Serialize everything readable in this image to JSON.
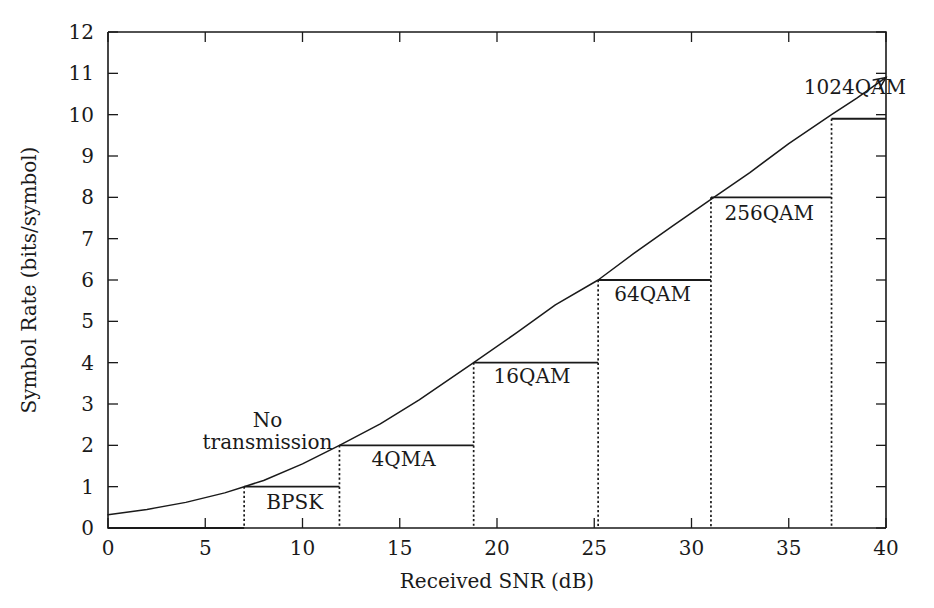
{
  "chart_data": {
    "type": "line",
    "title": "",
    "xlabel": "Received SNR (dB)",
    "ylabel": "Symbol Rate (bits/symbol)",
    "xlim": [
      0,
      40
    ],
    "ylim": [
      0,
      12
    ],
    "xticks": [
      "0",
      "5",
      "10",
      "15",
      "20",
      "25",
      "30",
      "35",
      "40"
    ],
    "xtick_values": [
      0,
      5,
      10,
      15,
      20,
      25,
      30,
      35,
      40
    ],
    "yticks": [
      "0",
      "1",
      "2",
      "3",
      "4",
      "5",
      "6",
      "7",
      "8",
      "9",
      "10",
      "11",
      "12"
    ],
    "ytick_values": [
      0,
      1,
      2,
      3,
      4,
      5,
      6,
      7,
      8,
      9,
      10,
      11,
      12
    ],
    "grid": false,
    "legend": "none",
    "series": [
      {
        "name": "Shannon capacity curve",
        "type": "line",
        "style": "solid",
        "arrow_end": true,
        "x": [
          0,
          2,
          4,
          6,
          7,
          8,
          10,
          11.9,
          14,
          16,
          18.8,
          21,
          23,
          25.2,
          27,
          29,
          31,
          33,
          35,
          37.2,
          38.5,
          40
        ],
        "y": [
          0.32,
          0.45,
          0.62,
          0.85,
          1.0,
          1.15,
          1.55,
          2.0,
          2.52,
          3.1,
          4.0,
          4.72,
          5.4,
          6.0,
          6.63,
          7.3,
          7.95,
          8.6,
          9.3,
          10.0,
          10.4,
          10.9
        ]
      },
      {
        "name": "Adaptive modulation step function",
        "type": "step",
        "boundaries": [
          0,
          7,
          11.9,
          18.8,
          25.2,
          31,
          37.2,
          40
        ],
        "levels": [
          0,
          1,
          2,
          4,
          6,
          8,
          9.9
        ]
      }
    ],
    "annotations": [
      {
        "text": "No",
        "x": 8.2,
        "y": 2.45,
        "label": "no-transmission-line1"
      },
      {
        "text": "transmission",
        "x": 8.2,
        "y": 1.9,
        "label": "no-transmission-line2"
      },
      {
        "text": "BPSK",
        "x": 9.6,
        "y": 0.45,
        "label": "bpsk-label"
      },
      {
        "text": "4QMA",
        "x": 15.2,
        "y": 1.5,
        "label": "4qma-label"
      },
      {
        "text": "16QAM",
        "x": 21.8,
        "y": 3.5,
        "label": "16qam-label"
      },
      {
        "text": "64QAM",
        "x": 28.0,
        "y": 5.5,
        "label": "64qam-label"
      },
      {
        "text": "256QAM",
        "x": 34.0,
        "y": 7.45,
        "label": "256qam-label"
      },
      {
        "text": "1024QAM",
        "x": 38.4,
        "y": 10.5,
        "label": "1024qam-label"
      }
    ],
    "colors": {
      "foreground": "#1a1a1a",
      "background": "#ffffff"
    }
  }
}
